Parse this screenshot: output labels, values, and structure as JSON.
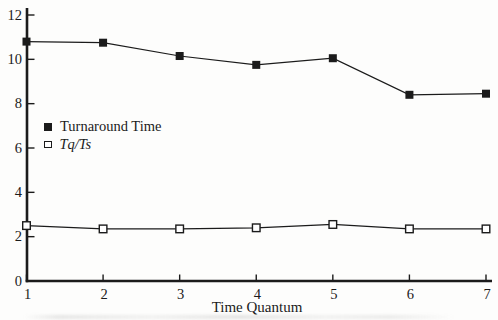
{
  "figure": {
    "background": "#fdfdfc",
    "ink": "#1b1b1b",
    "marker_open_fill": "#ffffff"
  },
  "chart_data": {
    "type": "line",
    "title": "",
    "xlabel": "Time Quantum",
    "ylabel": "",
    "x": [
      1,
      2,
      3,
      4,
      5,
      6,
      7
    ],
    "xlim": [
      1,
      7
    ],
    "ylim": [
      0,
      12
    ],
    "xticks": [
      1,
      2,
      3,
      4,
      5,
      6,
      7
    ],
    "yticks": [
      0,
      2,
      4,
      6,
      8,
      10,
      12
    ],
    "grid": false,
    "legend_position": "inside-left-middle",
    "series": [
      {
        "name": "Turnaround Time",
        "marker": "filled-square",
        "values": [
          10.8,
          10.75,
          10.15,
          9.75,
          10.05,
          8.4,
          8.45
        ]
      },
      {
        "name": "Tq/Ts",
        "marker": "open-square",
        "values": [
          2.5,
          2.35,
          2.35,
          2.4,
          2.55,
          2.35,
          2.35
        ]
      }
    ]
  }
}
